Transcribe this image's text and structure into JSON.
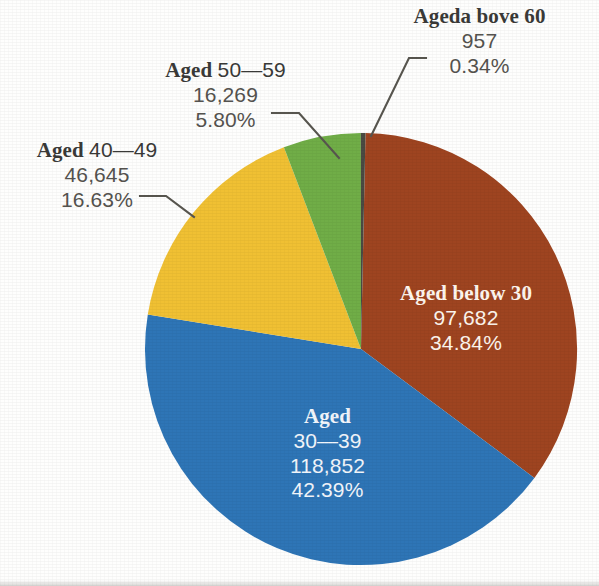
{
  "chart_data": {
    "type": "pie",
    "title": "",
    "subtitle": "",
    "xlabel": "",
    "ylabel": "",
    "legend_position": "none",
    "grid": false,
    "total": 280405,
    "categories": [
      "Aged below 30",
      "Aged 30—39",
      "Aged 40—49",
      "Aged 50—59",
      "Ageda bove 60"
    ],
    "values": [
      97682,
      118852,
      46645,
      16269,
      957
    ],
    "percentages": [
      34.84,
      42.39,
      16.63,
      5.8,
      0.34
    ],
    "colors": [
      "#9e4420",
      "#2e75b6",
      "#f0c033",
      "#70ad47",
      "#4a4a42"
    ],
    "slices": [
      {
        "name": "Aged below 30",
        "value": 97682,
        "value_text": "97,682",
        "percent": 34.84,
        "percent_text": "34.84%",
        "color": "#9e4420",
        "label_placement": "inside",
        "start_angle": 1.2,
        "end_angle": 126.6
      },
      {
        "name": "Aged 30—39",
        "value": 118852,
        "value_text": "118,852",
        "percent": 42.39,
        "percent_text": "42.39%",
        "color": "#2e75b6",
        "label_placement": "inside",
        "start_angle": 126.6,
        "end_angle": 279.2
      },
      {
        "name": "Aged 40—49",
        "value": 46645,
        "value_text": "46,645",
        "percent": 16.63,
        "percent_text": "16.63%",
        "color": "#f0c033",
        "label_placement": "outside",
        "start_angle": 279.2,
        "end_angle": 339.1
      },
      {
        "name": "Aged 50—59",
        "value": 16269,
        "value_text": "16,269",
        "percent": 5.8,
        "percent_text": "5.80%",
        "color": "#70ad47",
        "label_placement": "outside",
        "start_angle": 339.1,
        "end_angle": 359.9
      },
      {
        "name": "Ageda bove 60",
        "value": 957,
        "value_text": "957",
        "percent": 0.34,
        "percent_text": "0.34%",
        "color": "#4a4a42",
        "label_placement": "outside",
        "start_angle": 359.9,
        "end_angle": 361.2
      }
    ]
  },
  "labels": {
    "above_60": {
      "title": "Ageda bove 60",
      "value": "957",
      "percent": "0.34%"
    },
    "aged_50_59": {
      "title_word": "Aged",
      "range": "50—59",
      "value": "16,269",
      "percent": "5.80%"
    },
    "aged_40_49": {
      "title_word": "Aged",
      "range": "40—49",
      "value": "46,645",
      "percent": "16.63%"
    },
    "below_30": {
      "title": "Aged below 30",
      "value": "97,682",
      "percent": "34.84%"
    },
    "aged_30_39": {
      "title_word": "Aged",
      "range": "30—39",
      "value": "118,852",
      "percent": "42.39%"
    }
  },
  "style": {
    "background": "#fefefd",
    "text_dark": "#3a3a38",
    "text_number": "#55534f",
    "text_light": "#fdf6ee",
    "leader_line": "#58564f"
  }
}
